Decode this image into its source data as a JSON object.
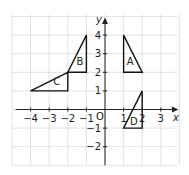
{
  "diagram": {
    "axes": {
      "x_label": "x",
      "y_label": "y",
      "origin_label": "O"
    },
    "x_ticks": [
      {
        "v": -4,
        "t": "−4"
      },
      {
        "v": -3,
        "t": "−3"
      },
      {
        "v": -2,
        "t": "−2"
      },
      {
        "v": -1,
        "t": "−1"
      },
      {
        "v": 1,
        "t": "1"
      },
      {
        "v": 2,
        "t": "2"
      },
      {
        "v": 3,
        "t": "3"
      }
    ],
    "y_ticks": [
      {
        "v": 4,
        "t": "4"
      },
      {
        "v": 3,
        "t": "3"
      },
      {
        "v": 2,
        "t": "2"
      },
      {
        "v": 1,
        "t": "1"
      },
      {
        "v": -1,
        "t": "−1"
      },
      {
        "v": -2,
        "t": "−2"
      }
    ],
    "shapes": [
      {
        "label": "A",
        "points": [
          [
            1,
            4
          ],
          [
            1,
            2
          ],
          [
            2,
            2
          ]
        ],
        "label_pos": [
          1.35,
          2.4
        ]
      },
      {
        "label": "B",
        "points": [
          [
            -1,
            4
          ],
          [
            -1,
            2
          ],
          [
            -2,
            2
          ]
        ],
        "label_pos": [
          -1.35,
          2.4
        ]
      },
      {
        "label": "C",
        "points": [
          [
            -4,
            1
          ],
          [
            -2,
            1
          ],
          [
            -2,
            2
          ]
        ],
        "label_pos": [
          -2.6,
          1.3
        ]
      },
      {
        "label": "D",
        "points": [
          [
            1,
            -1
          ],
          [
            2,
            -1
          ],
          [
            2,
            1
          ]
        ],
        "label_pos": [
          1.55,
          -0.85
        ]
      }
    ]
  }
}
